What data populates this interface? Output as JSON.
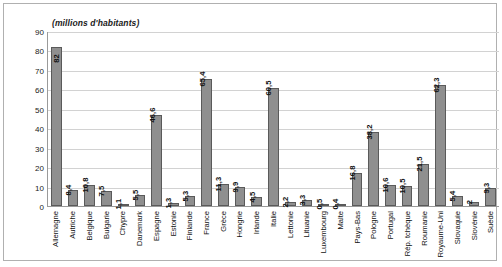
{
  "chart_data": {
    "type": "bar",
    "title": "(millions d'habitants)",
    "xlabel": "",
    "ylabel": "",
    "ylim": [
      0,
      90
    ],
    "yticks": [
      90,
      80,
      70,
      60,
      50,
      40,
      30,
      20,
      10,
      0
    ],
    "grid": true,
    "legend": "none",
    "bar_color": "#8f8f8f",
    "bar_border_color": "#5a5a5a",
    "categories": [
      "Allemagne",
      "Autriche",
      "Belgique",
      "Bulgarie",
      "Chypre",
      "Danemark",
      "Espagne",
      "Estonie",
      "Finlande",
      "France",
      "Grèce",
      "Hongrie",
      "Irlande",
      "Italie",
      "Lettonie",
      "Lituanie",
      "Luxembourg",
      "Malte",
      "Pays-Bas",
      "Pologne",
      "Portugal",
      "Rép. tchèque",
      "Roumanie",
      "Royaume-Uni",
      "Slovaquie",
      "Slovénie",
      "Suède"
    ],
    "values": [
      82,
      8.4,
      10.8,
      7.5,
      1.1,
      5.5,
      46.6,
      1.3,
      5.3,
      65.4,
      11.3,
      9.9,
      4.5,
      60.5,
      2.2,
      3.3,
      0.5,
      0.4,
      16.8,
      38.2,
      10.6,
      10.5,
      21.5,
      62.3,
      5.4,
      2,
      9.3
    ],
    "value_labels": [
      "82",
      "8,4",
      "10,8",
      "7,5",
      "1,1",
      "5,5",
      "46,6",
      "1,3",
      "5,3",
      "65,4",
      "11,3",
      "9,9",
      "4,5",
      "60,5",
      "2,2",
      "3,3",
      "0,5",
      "0,4",
      "16,8",
      "38,2",
      "10,6",
      "10,5",
      "21,5",
      "62,3",
      "5,4",
      "2",
      "9,3"
    ]
  }
}
